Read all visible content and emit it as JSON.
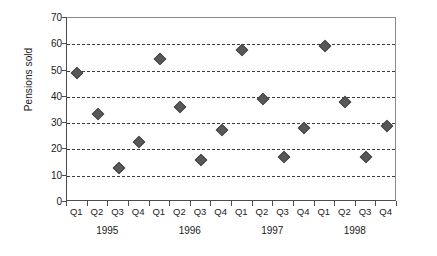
{
  "chart_data": {
    "type": "scatter",
    "title": "",
    "xlabel": "",
    "ylabel": "Pensions sold",
    "ylim": [
      0,
      70
    ],
    "yticks": [
      0,
      10,
      20,
      30,
      40,
      50,
      60,
      70
    ],
    "grid": true,
    "legend": "none",
    "marker_style": "diamond",
    "marker_color": "#58585a",
    "categories": [
      "Q1",
      "Q2",
      "Q3",
      "Q4",
      "Q1",
      "Q2",
      "Q3",
      "Q4",
      "Q1",
      "Q2",
      "Q3",
      "Q4",
      "Q1",
      "Q2",
      "Q3",
      "Q4"
    ],
    "group_labels": [
      "1995",
      "1996",
      "1997",
      "1998"
    ],
    "values": [
      49,
      33.5,
      13,
      23,
      54.5,
      36,
      16,
      27.5,
      58,
      39,
      17,
      28.3,
      59.5,
      38,
      17,
      28.8
    ],
    "points": [
      {
        "year": "1995",
        "quarter": "Q1",
        "value": 49
      },
      {
        "year": "1995",
        "quarter": "Q2",
        "value": 33.5
      },
      {
        "year": "1995",
        "quarter": "Q3",
        "value": 13
      },
      {
        "year": "1995",
        "quarter": "Q4",
        "value": 23
      },
      {
        "year": "1996",
        "quarter": "Q1",
        "value": 54.5
      },
      {
        "year": "1996",
        "quarter": "Q2",
        "value": 36
      },
      {
        "year": "1996",
        "quarter": "Q3",
        "value": 16
      },
      {
        "year": "1996",
        "quarter": "Q4",
        "value": 27.5
      },
      {
        "year": "1997",
        "quarter": "Q1",
        "value": 58
      },
      {
        "year": "1997",
        "quarter": "Q2",
        "value": 39
      },
      {
        "year": "1997",
        "quarter": "Q3",
        "value": 17
      },
      {
        "year": "1997",
        "quarter": "Q4",
        "value": 28.3
      },
      {
        "year": "1998",
        "quarter": "Q1",
        "value": 59.5
      },
      {
        "year": "1998",
        "quarter": "Q2",
        "value": 38
      },
      {
        "year": "1998",
        "quarter": "Q3",
        "value": 17
      },
      {
        "year": "1998",
        "quarter": "Q4",
        "value": 28.8
      }
    ]
  },
  "colors": {
    "marker": "#58585a",
    "gridline": "#3d3d3d",
    "axis": "#4d4d4d",
    "frame": "#8a8a8a",
    "text": "#1a1a1a",
    "background": "#ffffff"
  }
}
